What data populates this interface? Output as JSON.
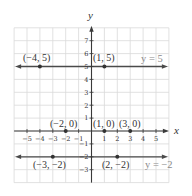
{
  "chart_data": {
    "type": "scatter",
    "title": "",
    "xlabel": "x",
    "ylabel": "y",
    "xlim": [
      -6,
      6
    ],
    "ylim": [
      -4,
      8
    ],
    "grid": true,
    "x_ticks": [
      -5,
      -4,
      -3,
      -2,
      -1,
      1,
      2,
      3,
      4,
      5
    ],
    "y_ticks": [
      -3,
      -2,
      -1,
      1,
      2,
      3,
      4,
      5,
      6,
      7
    ],
    "lines": [
      {
        "equation": "y = 5",
        "y": 5,
        "label": "y = 5"
      },
      {
        "equation": "y = -2",
        "y": -2,
        "label": "y = −2"
      }
    ],
    "points": [
      {
        "x": -4,
        "y": 5,
        "label": "(−4, 5)"
      },
      {
        "x": 1,
        "y": 5,
        "label": "(1, 5)"
      },
      {
        "x": -2,
        "y": 0,
        "label": "(−2, 0)"
      },
      {
        "x": 1,
        "y": 0,
        "label": "(1, 0)"
      },
      {
        "x": 3,
        "y": 0,
        "label": "(3, 0)"
      },
      {
        "x": -3,
        "y": -2,
        "label": "(−3, −2)"
      },
      {
        "x": 2,
        "y": -2,
        "label": "(2, −2)"
      }
    ]
  },
  "labels": {
    "x_axis": "x",
    "y_axis": "y",
    "line_y5": "y = 5",
    "line_yneg2": "y = −2",
    "p_neg4_5": "(−4, 5)",
    "p_1_5": "(1, 5)",
    "p_neg2_0": "(−2, 0)",
    "p_1_0": "(1, 0)",
    "p_3_0": "(3, 0)",
    "p_neg3_neg2": "(−3, −2)",
    "p_2_neg2": "(2, −2)"
  }
}
